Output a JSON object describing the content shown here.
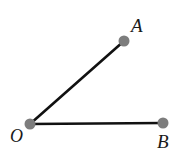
{
  "figure": {
    "type": "geometry-angle-diagram",
    "background_color": "#ffffff",
    "canvas": {
      "width": 186,
      "height": 156
    },
    "points": [
      {
        "id": "A",
        "label": "A",
        "x": 124,
        "y": 41,
        "dot_radius": 5.5,
        "dot_color": "#7d7d7d"
      },
      {
        "id": "O",
        "label": "O",
        "x": 30,
        "y": 124,
        "dot_radius": 5.5,
        "dot_color": "#7d7d7d"
      },
      {
        "id": "B",
        "label": "B",
        "x": 163,
        "y": 123,
        "dot_radius": 5.5,
        "dot_color": "#7d7d7d"
      }
    ],
    "segments": [
      {
        "id": "OA",
        "from": "O",
        "to": "A",
        "color": "#111111",
        "width": 2.6
      },
      {
        "id": "OB",
        "from": "O",
        "to": "B",
        "color": "#111111",
        "width": 2.6
      }
    ],
    "labels": {
      "a": "A",
      "o": "O",
      "b": "B"
    }
  }
}
